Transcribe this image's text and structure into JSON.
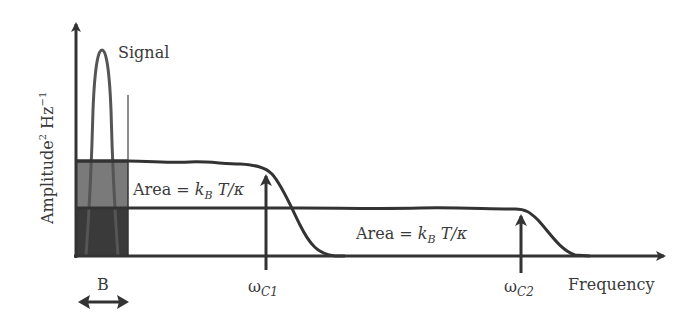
{
  "diagram": {
    "y_axis_label": "Amplitude",
    "y_axis_label_sup1": "2",
    "y_axis_label_unit": " Hz",
    "y_axis_label_sup2": "−1",
    "x_axis_label": "Frequency",
    "signal_label": "Signal",
    "bandwidth_label": "B",
    "area_label_1": {
      "prefix": "Area = ",
      "k": "k",
      "k_sub": "B",
      "suffix": " T/κ"
    },
    "area_label_2": {
      "prefix": "Area = ",
      "k": "k",
      "k_sub": "B",
      "suffix": " T/κ"
    },
    "cutoff_1": {
      "symbol": "ω",
      "sub": "C1"
    },
    "cutoff_2": {
      "symbol": "ω",
      "sub": "C2"
    },
    "colors": {
      "line": "#333333",
      "shade_upper": "#7a7a7a",
      "shade_lower": "#3a3a3a",
      "signal": "#555555",
      "background": "#ffffff"
    }
  }
}
